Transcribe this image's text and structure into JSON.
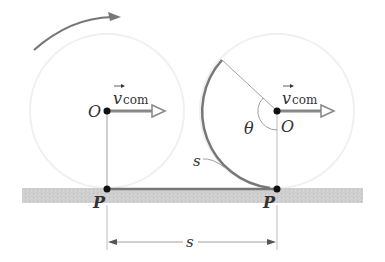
{
  "diagram": {
    "labels": {
      "center_left": "O",
      "center_right": "O",
      "contact_left": "P",
      "contact_right": "P",
      "velocity_symbol": "v",
      "velocity_subscript": "com",
      "angle": "θ",
      "arc_label": "s",
      "distance_label": "s"
    },
    "colors": {
      "ground": "#c8c8c8",
      "arc": "#777777",
      "line": "#888888",
      "point": "#111111",
      "faint_circle": "#f2f2f2"
    }
  }
}
